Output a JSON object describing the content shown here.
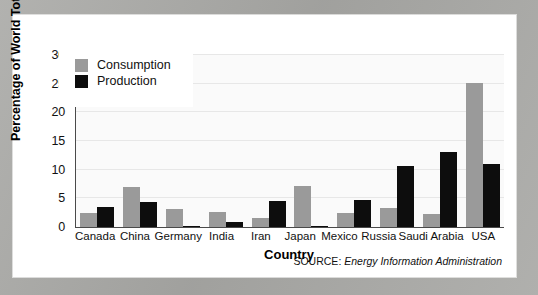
{
  "chart_data": {
    "type": "bar",
    "title": "",
    "xlabel": "Country",
    "ylabel": "Percentage of World Total",
    "ylim": [
      0,
      30
    ],
    "yticks": [
      0,
      5,
      10,
      15,
      20,
      25,
      30
    ],
    "grid": true,
    "legend_position": "top-left",
    "categories": [
      "Canada",
      "China",
      "Germany",
      "India",
      "Iran",
      "Japan",
      "Mexico",
      "Russia",
      "Saudi Arabia",
      "USA"
    ],
    "series": [
      {
        "name": "Consumption",
        "color": "#9a9a9a",
        "values": [
          2.4,
          6.9,
          3.2,
          2.6,
          1.5,
          7.1,
          2.4,
          3.3,
          2.2,
          25.2
        ]
      },
      {
        "name": "Production",
        "color": "#0d0d0d",
        "values": [
          3.5,
          4.4,
          0.2,
          0.8,
          4.6,
          0.1,
          4.7,
          10.7,
          13.0,
          11.0
        ]
      }
    ],
    "source_label": "SOURCE:",
    "source_name": "Energy Information Administration"
  },
  "legend": {
    "items": [
      {
        "label": "Consumption",
        "swatch": "consumption-swatch"
      },
      {
        "label": "Production",
        "swatch": "production-swatch"
      }
    ]
  }
}
